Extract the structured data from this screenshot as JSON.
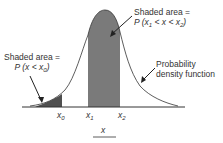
{
  "diagram": {
    "type": "normal-distribution-probability-diagram",
    "annotations": {
      "middle_area": {
        "line1": "Shaded area =",
        "line2_prefix": "P (x",
        "line2_sub1": "1",
        "line2_mid": " < x < x",
        "line2_sub2": "2",
        "line2_suffix": ")"
      },
      "left_area": {
        "line1": "Shaded area =",
        "line2_prefix": "P (x < x",
        "line2_sub": "0",
        "line2_suffix": ")"
      },
      "curve_label": {
        "line1": "Probability",
        "line2": "density function"
      }
    },
    "axis": {
      "ticks": [
        {
          "base": "x",
          "sub": "0"
        },
        {
          "base": "x",
          "sub": "1"
        },
        {
          "base": "x",
          "sub": "2"
        }
      ],
      "label": "x"
    },
    "colors": {
      "shade_dark": "#555555",
      "shade_mid": "#7a7a7a",
      "curve": "#333333"
    }
  }
}
